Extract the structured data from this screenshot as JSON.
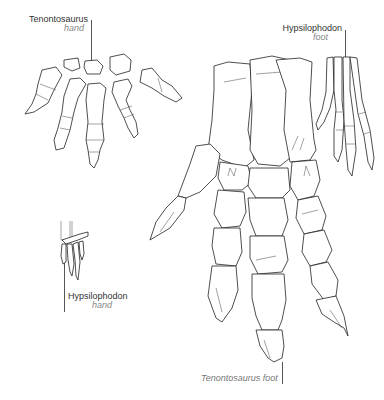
{
  "figure": {
    "labels": {
      "tenontosaurus_hand": {
        "name": "Tenontosaurus",
        "part": "hand"
      },
      "hypsilophodon_foot": {
        "name": "Hypsilophodon",
        "part": "foot"
      },
      "hypsilophodon_hand": {
        "name": "Hypsilophodon",
        "part": "hand"
      },
      "tenontosaurus_foot": {
        "caption": "Tenontosaurus foot"
      }
    },
    "colors": {
      "line": "#222222",
      "label_name": "#333333",
      "label_part": "#888888",
      "background": "#ffffff"
    }
  }
}
